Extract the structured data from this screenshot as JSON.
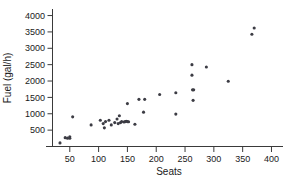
{
  "chart_data": {
    "type": "scatter",
    "title": "",
    "xlabel": "Seats",
    "ylabel": "Fuel (gal/h)",
    "xlim": [
      20,
      420
    ],
    "ylim": [
      0,
      4200
    ],
    "xticks": [
      50,
      100,
      150,
      200,
      250,
      300,
      350,
      400
    ],
    "yticks": [
      500,
      1000,
      1500,
      2000,
      2500,
      3000,
      3500,
      4000
    ],
    "xtick_labels": [
      "50",
      "100",
      "150",
      "200",
      "250",
      "300",
      "350",
      "400"
    ],
    "ytick_labels": [
      "500",
      "1000",
      "1500",
      "2000",
      "2500",
      "3000",
      "3500",
      "4000"
    ],
    "grid": false,
    "legend": null,
    "marker_color": "#3c3c44",
    "axis_color": "#3a3a3a",
    "background": "#ffffff",
    "x": [
      33,
      42,
      46,
      50,
      50,
      55,
      87,
      103,
      108,
      110,
      112,
      118,
      122,
      128,
      132,
      134,
      136,
      138,
      140,
      144,
      146,
      148,
      150,
      150,
      152,
      163,
      170,
      178,
      180,
      206,
      234,
      234,
      262,
      262,
      263,
      264,
      265,
      287,
      325,
      366,
      370
    ],
    "y": [
      110,
      270,
      255,
      300,
      250,
      905,
      660,
      800,
      700,
      570,
      760,
      800,
      660,
      730,
      840,
      700,
      940,
      730,
      760,
      750,
      760,
      770,
      760,
      1310,
      755,
      680,
      1440,
      1050,
      1440,
      1590,
      1640,
      990,
      2500,
      2180,
      1730,
      1410,
      1730,
      2430,
      1995,
      3430,
      3620
    ],
    "points": [
      {
        "seats": 33,
        "fuel": 110
      },
      {
        "seats": 42,
        "fuel": 270
      },
      {
        "seats": 46,
        "fuel": 255
      },
      {
        "seats": 50,
        "fuel": 300
      },
      {
        "seats": 50,
        "fuel": 250
      },
      {
        "seats": 55,
        "fuel": 905
      },
      {
        "seats": 87,
        "fuel": 660
      },
      {
        "seats": 103,
        "fuel": 800
      },
      {
        "seats": 108,
        "fuel": 700
      },
      {
        "seats": 110,
        "fuel": 570
      },
      {
        "seats": 112,
        "fuel": 760
      },
      {
        "seats": 118,
        "fuel": 800
      },
      {
        "seats": 122,
        "fuel": 660
      },
      {
        "seats": 128,
        "fuel": 730
      },
      {
        "seats": 132,
        "fuel": 840
      },
      {
        "seats": 134,
        "fuel": 700
      },
      {
        "seats": 136,
        "fuel": 940
      },
      {
        "seats": 138,
        "fuel": 730
      },
      {
        "seats": 140,
        "fuel": 760
      },
      {
        "seats": 144,
        "fuel": 750
      },
      {
        "seats": 146,
        "fuel": 760
      },
      {
        "seats": 148,
        "fuel": 770
      },
      {
        "seats": 150,
        "fuel": 760
      },
      {
        "seats": 150,
        "fuel": 1310
      },
      {
        "seats": 152,
        "fuel": 755
      },
      {
        "seats": 163,
        "fuel": 680
      },
      {
        "seats": 170,
        "fuel": 1440
      },
      {
        "seats": 178,
        "fuel": 1050
      },
      {
        "seats": 180,
        "fuel": 1440
      },
      {
        "seats": 206,
        "fuel": 1590
      },
      {
        "seats": 234,
        "fuel": 1640
      },
      {
        "seats": 234,
        "fuel": 990
      },
      {
        "seats": 262,
        "fuel": 2500
      },
      {
        "seats": 262,
        "fuel": 2180
      },
      {
        "seats": 263,
        "fuel": 1730
      },
      {
        "seats": 264,
        "fuel": 1410
      },
      {
        "seats": 265,
        "fuel": 1730
      },
      {
        "seats": 287,
        "fuel": 2430
      },
      {
        "seats": 325,
        "fuel": 1995
      },
      {
        "seats": 366,
        "fuel": 3430
      },
      {
        "seats": 370,
        "fuel": 3620
      }
    ]
  }
}
